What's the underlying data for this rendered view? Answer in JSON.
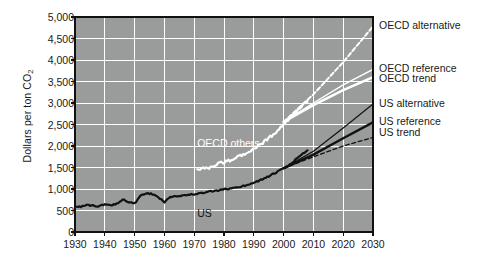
{
  "chart_data": {
    "type": "line",
    "title": "",
    "xlabel": "",
    "ylabel": "Dollars per ton CO2",
    "ylabel_display": "Dollars per ton CO",
    "ylabel_sub": "2",
    "xlim": [
      1930,
      2030
    ],
    "ylim": [
      0,
      5000
    ],
    "ytick_labels": [
      "0",
      "500",
      "1,000",
      "1,500",
      "2,000",
      "2,500",
      "3,000",
      "3,500",
      "4,000",
      "4,500",
      "5,000"
    ],
    "ytick_values": [
      0,
      500,
      1000,
      1500,
      2000,
      2500,
      3000,
      3500,
      4000,
      4500,
      5000
    ],
    "xtick_labels": [
      "1930",
      "1940",
      "1950",
      "1960",
      "1970",
      "1980",
      "1990",
      "2000",
      "2010",
      "2020",
      "2030"
    ],
    "xtick_values": [
      1930,
      1940,
      1950,
      1960,
      1970,
      1980,
      1990,
      2000,
      2010,
      2020,
      2030
    ],
    "grid": true,
    "plot_background": "#9a9b9b",
    "grid_color": "#ffffff",
    "frame_color": "#111111",
    "legend_position": "right-outside",
    "series": [
      {
        "name": "US",
        "label": "US",
        "color": "#111111",
        "style": "solid",
        "width": 2.2,
        "kind": "historical",
        "x": [
          1930,
          1932,
          1934,
          1936,
          1938,
          1940,
          1942,
          1944,
          1946,
          1948,
          1950,
          1952,
          1954,
          1956,
          1958,
          1960,
          1962,
          1964,
          1966,
          1968,
          1970,
          1972,
          1974,
          1976,
          1978,
          1980,
          1982,
          1984,
          1986,
          1988,
          1990,
          1992,
          1994,
          1996,
          1998,
          2000,
          2002,
          2004,
          2006,
          2008
        ],
        "y": [
          600,
          590,
          620,
          615,
          600,
          640,
          620,
          660,
          760,
          700,
          660,
          840,
          900,
          880,
          800,
          700,
          820,
          840,
          850,
          860,
          880,
          900,
          920,
          950,
          960,
          990,
          1010,
          1040,
          1060,
          1100,
          1150,
          1200,
          1260,
          1330,
          1400,
          1480,
          1560,
          1680,
          1800,
          1900
        ]
      },
      {
        "name": "OECD others",
        "label": "OECD others",
        "color": "#ffffff",
        "style": "solid",
        "width": 2.2,
        "kind": "historical",
        "x": [
          1971,
          1973,
          1975,
          1977,
          1979,
          1981,
          1983,
          1985,
          1987,
          1989,
          1991,
          1993,
          1995,
          1997,
          1999,
          2001,
          2003,
          2005,
          2007,
          2008
        ],
        "y": [
          1450,
          1480,
          1500,
          1560,
          1600,
          1640,
          1700,
          1760,
          1820,
          1900,
          1980,
          2080,
          2180,
          2300,
          2420,
          2560,
          2700,
          2850,
          2980,
          3050
        ]
      },
      {
        "name": "US trend",
        "label": "US trend",
        "color": "#111111",
        "style": "dashed",
        "width": 1.3,
        "kind": "projection",
        "x": [
          2000,
          2010,
          2020,
          2030
        ],
        "y": [
          1480,
          1750,
          2000,
          2200
        ]
      },
      {
        "name": "US reference",
        "label": "US reference",
        "color": "#111111",
        "style": "solid",
        "width": 2.4,
        "kind": "projection",
        "x": [
          2000,
          2010,
          2020,
          2030
        ],
        "y": [
          1480,
          1800,
          2180,
          2550
        ]
      },
      {
        "name": "US alternative",
        "label": "US alternative",
        "color": "#111111",
        "style": "solid",
        "width": 1.2,
        "kind": "projection",
        "x": [
          2000,
          2010,
          2020,
          2030
        ],
        "y": [
          1480,
          1880,
          2420,
          2980
        ]
      },
      {
        "name": "OECD trend",
        "label": "OECD trend",
        "color": "#ffffff",
        "style": "solid",
        "width": 2.4,
        "kind": "projection",
        "x": [
          2000,
          2010,
          2020,
          2030
        ],
        "y": [
          2560,
          2950,
          3300,
          3600
        ]
      },
      {
        "name": "OECD reference",
        "label": "OECD reference",
        "color": "#ffffff",
        "style": "solid",
        "width": 1.4,
        "kind": "projection",
        "x": [
          2000,
          2010,
          2020,
          2030
        ],
        "y": [
          2560,
          3000,
          3420,
          3780
        ]
      },
      {
        "name": "OECD alternative",
        "label": "OECD alternative",
        "color": "#ffffff",
        "style": "dashed",
        "width": 2.0,
        "kind": "projection",
        "x": [
          2000,
          2010,
          2020,
          2030
        ],
        "y": [
          2560,
          3200,
          3950,
          4780
        ]
      }
    ],
    "annotations": [
      {
        "text": "OECD others",
        "x": 1971,
        "y": 2050,
        "color": "#ffffff"
      },
      {
        "text": "US",
        "x": 1971,
        "y": 430,
        "color": "#111111"
      }
    ],
    "legend_entries": [
      {
        "label": "OECD alternative",
        "y": 4780
      },
      {
        "label": "OECD reference",
        "y": 3800
      },
      {
        "label": "OECD trend",
        "y": 3560
      },
      {
        "label": "US alternative",
        "y": 2980
      },
      {
        "label": "US reference",
        "y": 2560
      },
      {
        "label": "US trend",
        "y": 2300
      }
    ]
  }
}
